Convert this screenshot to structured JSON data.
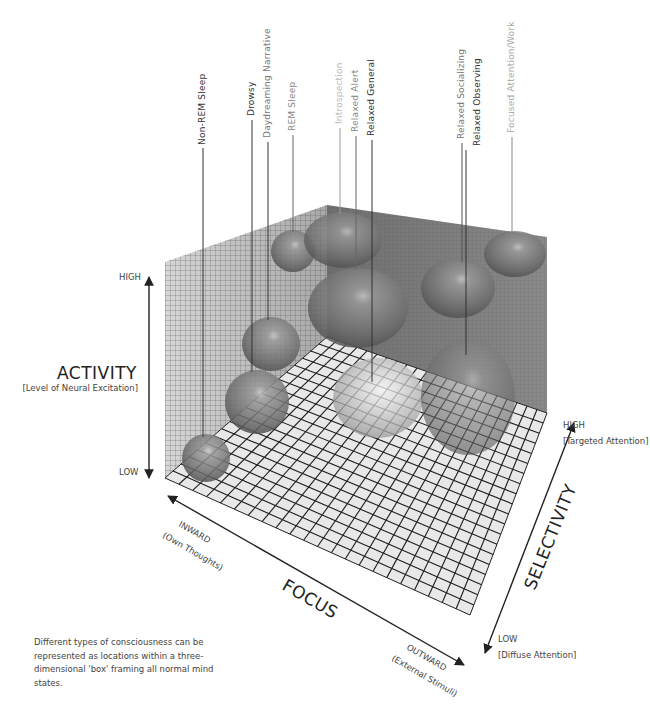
{
  "axes": {
    "activity": {
      "title": "ACTIVITY",
      "subtitle": "[Level of Neural Excitation]",
      "high": "HIGH",
      "low": "LOW"
    },
    "focus": {
      "title": "FOCUS",
      "inward": "INWARD",
      "inward_sub": "(Own Thoughts)",
      "outward": "OUTWARD",
      "outward_sub": "(External Stimuli)"
    },
    "selectivity": {
      "title": "SELECTIVITY",
      "high": "HIGH",
      "high_sub": "[Targeted Attention]",
      "low": "LOW",
      "low_sub": "[Diffuse Attention]"
    }
  },
  "states": [
    {
      "label": "Non-REM Sleep",
      "color": "#333333"
    },
    {
      "label": "Drowsy",
      "color": "#333333"
    },
    {
      "label": "Daydreaming Narrative",
      "color": "#777777"
    },
    {
      "label": "REM Sleep",
      "color": "#888888"
    },
    {
      "label": "Introspection",
      "color": "#bbbbbb"
    },
    {
      "label": "Relaxed Alert",
      "color": "#888888"
    },
    {
      "label": "Relaxed General",
      "color": "#333333"
    },
    {
      "label": "Relaxed Socializing",
      "color": "#777777"
    },
    {
      "label": "Relaxed Observing",
      "color": "#333333"
    },
    {
      "label": "Focused Attention/Work",
      "color": "#aaaaaa"
    }
  ],
  "caption": "Different types of consciousness can be represented as locations within a three-dimensional 'box' framing all normal mind states.",
  "colors": {
    "wall_left": "#cfcfcf",
    "wall_back": "#7a7a7a",
    "floor": "#e6e6e6",
    "grid": "#222222",
    "sphere": "#6e6e6e"
  }
}
